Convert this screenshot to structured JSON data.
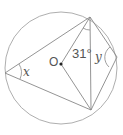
{
  "diagram": {
    "type": "circle-geometry",
    "center_label": "O",
    "angle_given": "31°",
    "angle_x_label": "x",
    "angle_y_label": "y",
    "colors": {
      "stroke": "#888888",
      "text": "#555555",
      "background": "#ffffff"
    }
  }
}
